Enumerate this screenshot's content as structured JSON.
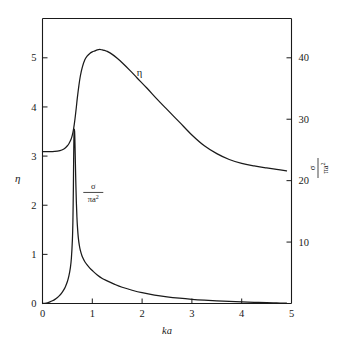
{
  "figure": {
    "background_color": "#ffffff",
    "line_color": "#1a1a1a",
    "axis_color": "#1a1a1a"
  },
  "labels": {
    "left_axis_title": "η",
    "right_axis_num": "σ",
    "right_axis_den": "πa",
    "right_axis_den_sup": "2",
    "x_axis_title": "ka",
    "eta_curve_label": "η",
    "sigma_curve_num": "σ",
    "sigma_curve_den": "πa",
    "sigma_curve_den_sup": "2"
  },
  "chart_data": {
    "type": "line",
    "title": "",
    "xlabel": "ka",
    "ylabel": "η",
    "y2label": "σ/πa²",
    "xlim": [
      0,
      5
    ],
    "ylim": [
      0,
      5.8
    ],
    "y2lim": [
      0,
      46.4
    ],
    "grid": false,
    "legend": "inline-annotations",
    "xticks": [
      0,
      1,
      2,
      3,
      4,
      5
    ],
    "xticklabels": [
      "0",
      "1",
      "2",
      "3",
      "4",
      "5"
    ],
    "yticks": [
      0,
      1,
      2,
      3,
      4,
      5
    ],
    "yticklabels": [
      "0",
      "1",
      "2",
      "3",
      "4",
      "5"
    ],
    "y2ticks": [
      10,
      20,
      30,
      40
    ],
    "y2ticklabels": [
      "10",
      "20",
      "30",
      "40"
    ],
    "series": [
      {
        "name": "η",
        "axis": "left",
        "annotation": "η",
        "annotation_xy": [
          1.95,
          4.62
        ],
        "x": [
          0.0,
          0.1,
          0.2,
          0.3,
          0.35,
          0.4,
          0.45,
          0.5,
          0.53,
          0.56,
          0.58,
          0.6,
          0.62,
          0.64,
          0.66,
          0.68,
          0.7,
          0.73,
          0.76,
          0.8,
          0.85,
          0.9,
          0.95,
          1.0,
          1.05,
          1.1,
          1.15,
          1.2,
          1.25,
          1.3,
          1.4,
          1.5,
          1.6,
          1.75,
          1.9,
          2.1,
          2.3,
          2.5,
          2.75,
          3.0,
          3.25,
          3.5,
          3.75,
          4.0,
          4.25,
          4.5,
          4.7,
          4.9
        ],
        "y": [
          3.09,
          3.09,
          3.09,
          3.1,
          3.11,
          3.13,
          3.16,
          3.21,
          3.25,
          3.31,
          3.36,
          3.43,
          3.53,
          3.66,
          3.82,
          4.0,
          4.19,
          4.43,
          4.63,
          4.81,
          4.96,
          5.04,
          5.09,
          5.12,
          5.14,
          5.16,
          5.17,
          5.16,
          5.15,
          5.13,
          5.07,
          4.99,
          4.9,
          4.75,
          4.59,
          4.38,
          4.16,
          3.95,
          3.69,
          3.43,
          3.21,
          3.05,
          2.93,
          2.85,
          2.8,
          2.76,
          2.73,
          2.7
        ]
      },
      {
        "name": "σ/πa²",
        "axis": "right",
        "annotation": "σ/πa²",
        "annotation_xy": [
          1.02,
          2.26
        ],
        "x": [
          0.0,
          0.05,
          0.1,
          0.15,
          0.2,
          0.25,
          0.3,
          0.34,
          0.38,
          0.42,
          0.46,
          0.5,
          0.53,
          0.56,
          0.58,
          0.6,
          0.61,
          0.62,
          0.625,
          0.63,
          0.635,
          0.64,
          0.645,
          0.65,
          0.655,
          0.66,
          0.67,
          0.68,
          0.69,
          0.7,
          0.72,
          0.74,
          0.76,
          0.78,
          0.8,
          0.85,
          0.9,
          0.95,
          1.0,
          1.1,
          1.2,
          1.3,
          1.45,
          1.6,
          1.8,
          2.0,
          2.25,
          2.5,
          2.75,
          3.0,
          3.25,
          3.5,
          3.75,
          4.0,
          4.25,
          4.5,
          4.7,
          4.9
        ],
        "y": [
          0.0,
          0.004,
          0.015,
          0.032,
          0.055,
          0.084,
          0.122,
          0.16,
          0.207,
          0.266,
          0.343,
          0.447,
          0.56,
          0.73,
          0.92,
          1.29,
          1.65,
          2.35,
          2.9,
          3.3,
          3.5,
          3.55,
          3.5,
          3.34,
          3.12,
          2.88,
          2.42,
          2.06,
          1.79,
          1.59,
          1.33,
          1.18,
          1.08,
          1.01,
          0.95,
          0.85,
          0.78,
          0.72,
          0.67,
          0.58,
          0.51,
          0.46,
          0.39,
          0.33,
          0.27,
          0.22,
          0.172,
          0.136,
          0.108,
          0.086,
          0.069,
          0.055,
          0.043,
          0.033,
          0.025,
          0.018,
          0.012,
          0.006
        ]
      }
    ]
  }
}
